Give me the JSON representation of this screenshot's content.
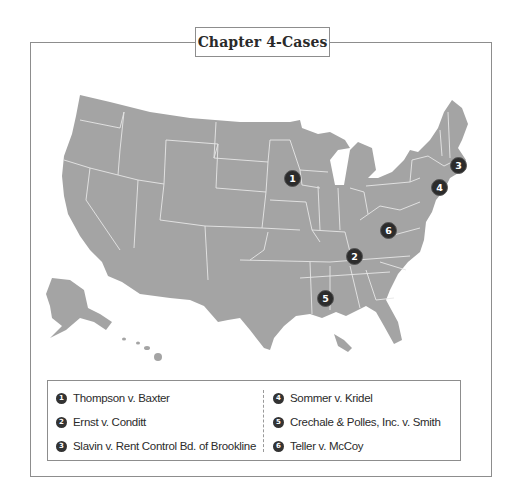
{
  "title": "Chapter 4-Cases",
  "map": {
    "region": "United States",
    "land_color": "#a4a4a4",
    "border_color": "#e8e8e8",
    "marker_color": "#2c2c2c",
    "markers": [
      {
        "id": "1",
        "label": "1",
        "location": "Minnesota/Wisconsin",
        "x": 292,
        "y": 178
      },
      {
        "id": "2",
        "label": "2",
        "location": "Tennessee",
        "x": 354,
        "y": 256
      },
      {
        "id": "3",
        "label": "3",
        "location": "Massachusetts",
        "x": 458,
        "y": 165
      },
      {
        "id": "4",
        "label": "4",
        "location": "New Jersey",
        "x": 439,
        "y": 187
      },
      {
        "id": "5",
        "label": "5",
        "location": "Mississippi",
        "x": 325,
        "y": 298
      },
      {
        "id": "6",
        "label": "6",
        "location": "West Virginia/Kentucky",
        "x": 388,
        "y": 230
      }
    ]
  },
  "legend": {
    "items": [
      {
        "number": "1",
        "text": "Thompson v. Baxter"
      },
      {
        "number": "2",
        "text": "Ernst v. Conditt"
      },
      {
        "number": "3",
        "text": "Slavin v. Rent Control Bd. of Brookline"
      },
      {
        "number": "4",
        "text": "Sommer v. Kridel"
      },
      {
        "number": "5",
        "text": "Crechale & Polles, Inc. v. Smith"
      },
      {
        "number": "6",
        "text": "Teller v. McCoy"
      }
    ]
  }
}
